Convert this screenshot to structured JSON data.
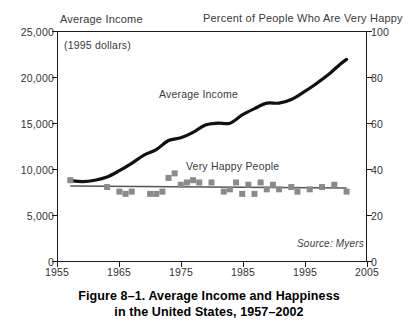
{
  "figure": {
    "caption_line1": "Figure 8–1.  Average Income and Happiness",
    "caption_line2": "in the United States, 1957–2002",
    "source": "Source: Myers",
    "units_note": "(1995 dollars)",
    "top_left_label": "Average Income",
    "top_right_label": "Percent of People Who Are Very Happy"
  },
  "chart_data": {
    "type": "line",
    "title": "Figure 8–1.  Average Income and Happiness in the United States, 1957–2002",
    "subtitle": "(1995 dollars)",
    "xlabel": "",
    "ylabel": "Average Income",
    "y2label": "Percent of People Who Are Very Happy",
    "xlim": [
      1955,
      2005
    ],
    "ylim": [
      0,
      25000
    ],
    "y2lim": [
      0,
      100
    ],
    "grid": false,
    "legend": "inline-annotations",
    "xticks": [
      "1955",
      "1965",
      "1975",
      "1985",
      "1995",
      "2005"
    ],
    "xtick_values": [
      1955,
      1965,
      1975,
      1985,
      1995,
      2005
    ],
    "yticks": [
      "0",
      "5,000",
      "10,000",
      "15,000",
      "20,000",
      "25,000"
    ],
    "ytick_values": [
      0,
      5000,
      10000,
      15000,
      20000,
      25000
    ],
    "y2ticks": [
      "0",
      "20",
      "40",
      "60",
      "80",
      "100"
    ],
    "y2tick_values": [
      0,
      20,
      40,
      60,
      80,
      100
    ],
    "annotations": [
      {
        "text": "Average Income",
        "x": 1974,
        "y": 15900
      },
      {
        "text": "Very Happy People",
        "x": 1979,
        "y": 9600
      },
      {
        "text": "Source: Myers",
        "x": 2000,
        "y": 1400
      },
      {
        "text": "(1995 dollars)",
        "x": 1956.5,
        "y": 24100
      }
    ],
    "series": [
      {
        "name": "Average Income",
        "axis": "left",
        "style": "line",
        "color": "#111111",
        "x": [
          1957,
          1959,
          1961,
          1963,
          1965,
          1967,
          1969,
          1971,
          1973,
          1975,
          1977,
          1979,
          1981,
          1983,
          1985,
          1987,
          1989,
          1991,
          1993,
          1995,
          1997,
          1999,
          2001,
          2002
        ],
        "values": [
          8700,
          8600,
          8750,
          9100,
          9800,
          10600,
          11500,
          12100,
          13100,
          13400,
          14000,
          14800,
          15000,
          15000,
          15900,
          16600,
          17200,
          17200,
          17600,
          18400,
          19300,
          20300,
          21500,
          22000
        ]
      },
      {
        "name": "Very Happy People",
        "axis": "right",
        "style": "scatter-with-trend",
        "color": "#8a8a8a",
        "trend_color": "#555555",
        "x": [
          1957,
          1963,
          1965,
          1966,
          1967,
          1970,
          1971,
          1972,
          1973,
          1974,
          1975,
          1976,
          1977,
          1978,
          1980,
          1982,
          1983,
          1984,
          1985,
          1986,
          1987,
          1988,
          1989,
          1990,
          1991,
          1993,
          1994,
          1996,
          1998,
          2000,
          2002
        ],
        "values": [
          35,
          32,
          30,
          29,
          30,
          29,
          29,
          30,
          36,
          38,
          33,
          34,
          35,
          34,
          34,
          30,
          31,
          34,
          29,
          33,
          29,
          34,
          31,
          33,
          31,
          32,
          30,
          31,
          32,
          33,
          30
        ]
      }
    ]
  }
}
